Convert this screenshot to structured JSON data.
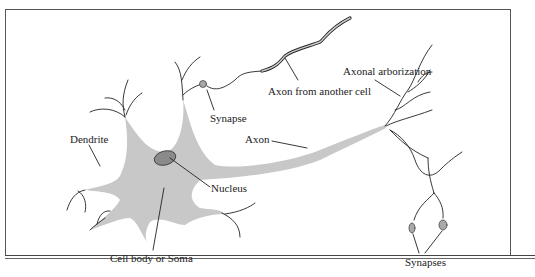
{
  "diagram": {
    "labels": {
      "dendrite": "Dendrite",
      "synapse": "Synapse",
      "axon_from_another_cell": "Axon from another cell",
      "axonal_arborization": "Axonal arborization",
      "axon": "Axon",
      "nucleus": "Nucleus",
      "cell_body": "Cell body or Soma",
      "synapses": "Synapses"
    },
    "colors": {
      "soma_fill": "#c8c8c8",
      "nucleus_fill": "#8a8a8a",
      "line": "#222222"
    }
  }
}
